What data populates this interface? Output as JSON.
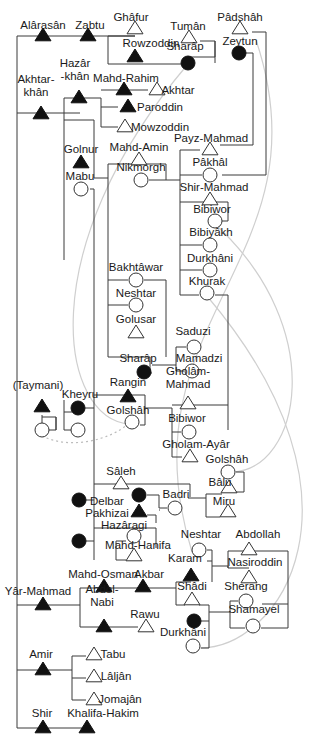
{
  "diagram": {
    "title": "",
    "legend": {
      "filled_triangle": "male (filled)",
      "open_triangle": "male",
      "filled_circle": "female (filled)",
      "open_circle": "female"
    },
    "people": [
      {
        "id": "alarasan",
        "name": "Alârasân",
        "sex": "m",
        "filled": true,
        "x": 43,
        "y": 36,
        "lx": 43,
        "ly": 29
      },
      {
        "id": "zabtu",
        "name": "Zabtu",
        "sex": "m",
        "filled": true,
        "x": 88,
        "y": 36,
        "lx": 90,
        "ly": 29
      },
      {
        "id": "ghafur",
        "name": "Ghâfur",
        "sex": "m",
        "filled": false,
        "x": 135,
        "y": 29,
        "lx": 131,
        "ly": 21
      },
      {
        "id": "rowzoddin",
        "name": "Rowzoddin",
        "sex": "m",
        "filled": true,
        "x": 135,
        "y": 57,
        "lx": 151,
        "ly": 47
      },
      {
        "id": "tuman",
        "name": "Tumân",
        "sex": "m",
        "filled": false,
        "x": 189,
        "y": 38,
        "lx": 188,
        "ly": 30
      },
      {
        "id": "sharap1",
        "name": "Sharâp",
        "sex": "f",
        "filled": true,
        "x": 188,
        "y": 63,
        "lx": 185,
        "ly": 50
      },
      {
        "id": "padshah",
        "name": "Pâdshâh",
        "sex": "m",
        "filled": false,
        "x": 240,
        "y": 29,
        "lx": 240,
        "ly": 21
      },
      {
        "id": "zeytun",
        "name": "Zeytun",
        "sex": "f",
        "filled": true,
        "x": 239,
        "y": 53,
        "lx": 240,
        "ly": 45
      },
      {
        "id": "akhtarkhan",
        "name": "Akhtar-\nkhân",
        "sex": "m",
        "filled": true,
        "x": 41,
        "y": 114,
        "lx": 36,
        "ly": 96
      },
      {
        "id": "hazarkhan",
        "name": "Hazâr\n-khân",
        "sex": "m",
        "filled": true,
        "x": 79,
        "y": 98,
        "lx": 75,
        "ly": 80
      },
      {
        "id": "mahdrahim",
        "name": "Mahd-Rahim",
        "sex": "m",
        "filled": true,
        "x": 124,
        "y": 90,
        "lx": 126,
        "ly": 82
      },
      {
        "id": "akhtar",
        "name": "Akhtar",
        "sex": "m",
        "filled": false,
        "x": 157,
        "y": 90,
        "lx": 178,
        "ly": 94
      },
      {
        "id": "paroddin",
        "name": "Paroddin",
        "sex": "m",
        "filled": true,
        "x": 128,
        "y": 107,
        "lx": 160,
        "ly": 111
      },
      {
        "id": "mowzoddin",
        "name": "Mowzoddin",
        "sex": "m",
        "filled": false,
        "x": 125,
        "y": 127,
        "lx": 160,
        "ly": 131
      },
      {
        "id": "golnur",
        "name": "Golnur",
        "sex": "m",
        "filled": true,
        "x": 81,
        "y": 163,
        "lx": 81,
        "ly": 153
      },
      {
        "id": "mabu",
        "name": "Mabu",
        "sex": "f",
        "filled": false,
        "x": 81,
        "y": 189,
        "lx": 80,
        "ly": 180
      },
      {
        "id": "mahdamin",
        "name": "Mahd-Amin",
        "sex": "m",
        "filled": false,
        "x": 139,
        "y": 160,
        "lx": 139,
        "ly": 151
      },
      {
        "id": "nikmorgh",
        "name": "Nikmorgh",
        "sex": "f",
        "filled": false,
        "x": 141,
        "y": 180,
        "lx": 141,
        "ly": 171
      },
      {
        "id": "payzmahmad",
        "name": "Payz-Mahmad",
        "sex": "m",
        "filled": false,
        "x": 210,
        "y": 150,
        "lx": 211,
        "ly": 142
      },
      {
        "id": "pakhal",
        "name": "Pâkhâl",
        "sex": "f",
        "filled": false,
        "x": 210,
        "y": 175,
        "lx": 210,
        "ly": 166
      },
      {
        "id": "shirmahmad",
        "name": "Shir-Mahmad",
        "sex": "m",
        "filled": false,
        "x": 210,
        "y": 200,
        "lx": 214,
        "ly": 191
      },
      {
        "id": "bibiwor1",
        "name": "Bibiwor",
        "sex": "f",
        "filled": false,
        "x": 215,
        "y": 221,
        "lx": 212,
        "ly": 213
      },
      {
        "id": "bibiyakh",
        "name": "Bibiyâkh",
        "sex": "f",
        "filled": false,
        "x": 210,
        "y": 245,
        "lx": 211,
        "ly": 236
      },
      {
        "id": "durkhani1",
        "name": "Durkhâni",
        "sex": "f",
        "filled": false,
        "x": 210,
        "y": 270,
        "lx": 210,
        "ly": 262
      },
      {
        "id": "khurak",
        "name": "Khurak",
        "sex": "f",
        "filled": false,
        "x": 207,
        "y": 293,
        "lx": 207,
        "ly": 285
      },
      {
        "id": "bakhtawar",
        "name": "Bakhtâwar",
        "sex": "f",
        "filled": false,
        "x": 136,
        "y": 280,
        "lx": 136,
        "ly": 271
      },
      {
        "id": "neshtar1",
        "name": "Neshtar",
        "sex": "f",
        "filled": false,
        "x": 136,
        "y": 305,
        "lx": 136,
        "ly": 297
      },
      {
        "id": "golusar",
        "name": "Golusar",
        "sex": "m",
        "filled": false,
        "x": 136,
        "y": 333,
        "lx": 136,
        "ly": 323
      },
      {
        "id": "sharap2",
        "name": "Sharâp",
        "sex": "f",
        "filled": true,
        "x": 144,
        "y": 372,
        "lx": 138,
        "ly": 362
      },
      {
        "id": "saduzi",
        "name": "Saduzi",
        "sex": "f",
        "filled": false,
        "x": 194,
        "y": 347,
        "lx": 193,
        "ly": 335
      },
      {
        "id": "mamadzi",
        "name": "Mamadzi",
        "sex": "f",
        "filled": false,
        "x": 192,
        "y": 371,
        "lx": 199,
        "ly": 362
      },
      {
        "id": "taymani",
        "name": "(Taymani)",
        "sex": "m",
        "filled": true,
        "x": 42,
        "y": 407,
        "lx": 38,
        "ly": 389
      },
      {
        "id": "kheyru",
        "name": "Kheyru",
        "sex": "f",
        "filled": true,
        "x": 78,
        "y": 408,
        "lx": 80,
        "ly": 398
      },
      {
        "id": "tay_child_f1",
        "name": "",
        "sex": "f",
        "filled": false,
        "x": 42,
        "y": 430,
        "lx": 0,
        "ly": 0
      },
      {
        "id": "tay_child_f2",
        "name": "",
        "sex": "f",
        "filled": false,
        "x": 78,
        "y": 430,
        "lx": 0,
        "ly": 0
      },
      {
        "id": "rangin",
        "name": "Rangin",
        "sex": "m",
        "filled": true,
        "x": 128,
        "y": 397,
        "lx": 128,
        "ly": 386
      },
      {
        "id": "golshah1",
        "name": "Golshâh",
        "sex": "f",
        "filled": false,
        "x": 132,
        "y": 422,
        "lx": 128,
        "ly": 414
      },
      {
        "id": "gholammahmad",
        "name": "Gholâm-\nMahmad",
        "sex": "m",
        "filled": false,
        "x": 188,
        "y": 404,
        "lx": 188,
        "ly": 388
      },
      {
        "id": "bibiwor2",
        "name": "Bibiwor",
        "sex": "f",
        "filled": false,
        "x": 189,
        "y": 432,
        "lx": 187,
        "ly": 422
      },
      {
        "id": "gholamayar",
        "name": "Gholam-Ayâr",
        "sex": "m",
        "filled": false,
        "x": 190,
        "y": 457,
        "lx": 196,
        "ly": 448
      },
      {
        "id": "golshah2",
        "name": "Golshâh",
        "sex": "f",
        "filled": false,
        "x": 228,
        "y": 472,
        "lx": 227,
        "ly": 463
      },
      {
        "id": "balu",
        "name": "Bâlu",
        "sex": "m",
        "filled": false,
        "x": 229,
        "y": 488,
        "lx": 220,
        "ly": 486
      },
      {
        "id": "miru",
        "name": "Miru",
        "sex": "m",
        "filled": false,
        "x": 228,
        "y": 512,
        "lx": 224,
        "ly": 505
      },
      {
        "id": "saleh",
        "name": "Sâleh",
        "sex": "m",
        "filled": false,
        "x": 121,
        "y": 484,
        "lx": 121,
        "ly": 475
      },
      {
        "id": "delbar_wife",
        "name": "",
        "sex": "f",
        "filled": true,
        "x": 79,
        "y": 500,
        "lx": 0,
        "ly": 0
      },
      {
        "id": "delbar",
        "name": "Delbar",
        "sex": "f",
        "filled": true,
        "x": 139,
        "y": 495,
        "lx": 107,
        "ly": 505
      },
      {
        "id": "badri",
        "name": "Badri",
        "sex": "f",
        "filled": false,
        "x": 175,
        "y": 508,
        "lx": 176,
        "ly": 498
      },
      {
        "id": "pakhizai",
        "name": "Pakhizai",
        "sex": "m",
        "filled": true,
        "x": 139,
        "y": 512,
        "lx": 107,
        "ly": 517
      },
      {
        "id": "hazaragi",
        "name": "Hazâragi",
        "sex": "f",
        "filled": false,
        "x": 134,
        "y": 536,
        "lx": 124,
        "ly": 529
      },
      {
        "id": "mahd_wife",
        "name": "",
        "sex": "f",
        "filled": true,
        "x": 79,
        "y": 541,
        "lx": 0,
        "ly": 0
      },
      {
        "id": "mahdhanifa",
        "name": "Mahd-Hanifa",
        "sex": "m",
        "filled": false,
        "x": 134,
        "y": 556,
        "lx": 138,
        "ly": 549
      },
      {
        "id": "neshtar2",
        "name": "Neshtar",
        "sex": "f",
        "filled": false,
        "x": 199,
        "y": 550,
        "lx": 201,
        "ly": 538
      },
      {
        "id": "abdollah",
        "name": "Abdollah",
        "sex": "m",
        "filled": false,
        "x": 249,
        "y": 550,
        "lx": 258,
        "ly": 538
      },
      {
        "id": "karam",
        "name": "Karam",
        "sex": "m",
        "filled": true,
        "x": 191,
        "y": 576,
        "lx": 185,
        "ly": 562
      },
      {
        "id": "nasiroddin",
        "name": "Nasiroddin",
        "sex": "m",
        "filled": false,
        "x": 249,
        "y": 578,
        "lx": 255,
        "ly": 566
      },
      {
        "id": "mahdosman",
        "name": "Mahd-Osman",
        "sex": "m",
        "filled": true,
        "x": 104,
        "y": 587,
        "lx": 103,
        "ly": 578
      },
      {
        "id": "akbar",
        "name": "Akbar",
        "sex": "m",
        "filled": true,
        "x": 143,
        "y": 587,
        "lx": 149,
        "ly": 578
      },
      {
        "id": "shadi",
        "name": "Shâdi",
        "sex": "m",
        "filled": false,
        "x": 192,
        "y": 600,
        "lx": 192,
        "ly": 590
      },
      {
        "id": "sherang",
        "name": "Sherang",
        "sex": "f",
        "filled": false,
        "x": 246,
        "y": 601,
        "lx": 246,
        "ly": 590
      },
      {
        "id": "shamayel",
        "name": "Shamayel",
        "sex": "f",
        "filled": false,
        "x": 253,
        "y": 626,
        "lx": 254,
        "ly": 613
      },
      {
        "id": "yarmahmad",
        "name": "Yâr-Mahmad",
        "sex": "m",
        "filled": true,
        "x": 43,
        "y": 605,
        "lx": 38,
        "ly": 595
      },
      {
        "id": "abdolnabi",
        "name": "Abdol-\nNabi",
        "sex": "m",
        "filled": true,
        "x": 104,
        "y": 627,
        "lx": 102,
        "ly": 606
      },
      {
        "id": "rawu",
        "name": "Rawu",
        "sex": "m",
        "filled": false,
        "x": 146,
        "y": 627,
        "lx": 145,
        "ly": 618
      },
      {
        "id": "durkhani2_mother",
        "name": "",
        "sex": "f",
        "filled": true,
        "x": 194,
        "y": 621,
        "lx": 0,
        "ly": 0
      },
      {
        "id": "durkhani2",
        "name": "Durkhâni",
        "sex": "f",
        "filled": false,
        "x": 193,
        "y": 646,
        "lx": 183,
        "ly": 636
      },
      {
        "id": "amir",
        "name": "Amir",
        "sex": "m",
        "filled": true,
        "x": 43,
        "y": 670,
        "lx": 41,
        "ly": 658
      },
      {
        "id": "tabu",
        "name": "Tabu",
        "sex": "m",
        "filled": false,
        "x": 94,
        "y": 655,
        "lx": 113,
        "ly": 658
      },
      {
        "id": "laljan",
        "name": "Lâljân",
        "sex": "m",
        "filled": false,
        "x": 94,
        "y": 677,
        "lx": 116,
        "ly": 680
      },
      {
        "id": "jomajan",
        "name": "Jomajân",
        "sex": "m",
        "filled": false,
        "x": 94,
        "y": 700,
        "lx": 120,
        "ly": 703
      },
      {
        "id": "shir",
        "name": "Shir",
        "sex": "m",
        "filled": true,
        "x": 43,
        "y": 728,
        "lx": 42,
        "ly": 717
      },
      {
        "id": "khalifahakim",
        "name": "Khalifa-Hakim",
        "sex": "m",
        "filled": true,
        "x": 87,
        "y": 728,
        "lx": 103,
        "ly": 717
      }
    ]
  }
}
